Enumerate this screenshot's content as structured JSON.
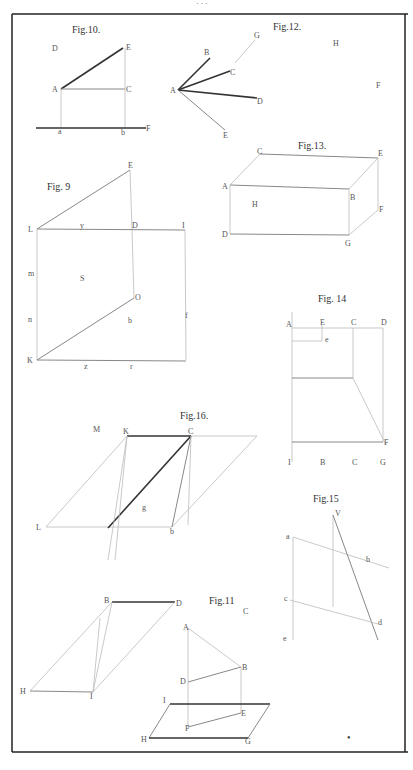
{
  "plate": {
    "header_mark": "· · ·",
    "figures": {
      "fig10": {
        "title": "Fig.10.",
        "labels": {
          "D": "D",
          "E": "E",
          "A": "A",
          "C": "C",
          "a": "a",
          "b": "b",
          "F": "F",
          "x": "."
        }
      },
      "fig12": {
        "title": "Fig.12.",
        "labels": {
          "A": "A",
          "B": "B",
          "G": "G",
          "C": "C",
          "D": "D",
          "E": "E",
          "H": "H",
          "F": "F"
        }
      },
      "fig9": {
        "title": "Fig. 9",
        "labels": {
          "E": "E",
          "L": "L",
          "D": "D",
          "I": "I",
          "K": "K",
          "O": "O",
          "m": "m",
          "n": "n",
          "f": "f",
          "S": "S",
          "b": "b",
          "z": "z",
          "y": "y",
          "r": "r"
        }
      },
      "fig13": {
        "title": "Fig.13.",
        "labels": {
          "C": "C",
          "E": "E",
          "A": "A",
          "B": "B",
          "H": "H",
          "F": "F",
          "D": "D",
          "G": "G"
        }
      },
      "fig14": {
        "title": "Fig. 14",
        "labels": {
          "A": "A",
          "E": "E",
          "C": "C",
          "D": "D",
          "e": "e",
          "F": "F",
          "I": "I",
          "B2": "B",
          "C2": "C",
          "G": "G"
        }
      },
      "fig16": {
        "title": "Fig.16.",
        "labels": {
          "M": "M",
          "K": "K",
          "C": "C",
          "L": "L",
          "g": "g",
          "b": "b"
        }
      },
      "fig15": {
        "title": "Fig.15",
        "labels": {
          "V": "V",
          "a": "a",
          "b": "b",
          "c": "c",
          "d": "d",
          "e": "e"
        }
      },
      "fig11": {
        "title": "Fig.11",
        "labels": {
          "C": "C",
          "A": "A",
          "B": "B",
          "D": "D",
          "E": "E",
          "F": "F",
          "G": "G",
          "H": "H",
          "I": "I"
        }
      },
      "lower_left": {
        "labels": {
          "B": "B",
          "D": "D",
          "H": "H",
          "I": "I"
        }
      }
    },
    "page_mark": "•"
  }
}
